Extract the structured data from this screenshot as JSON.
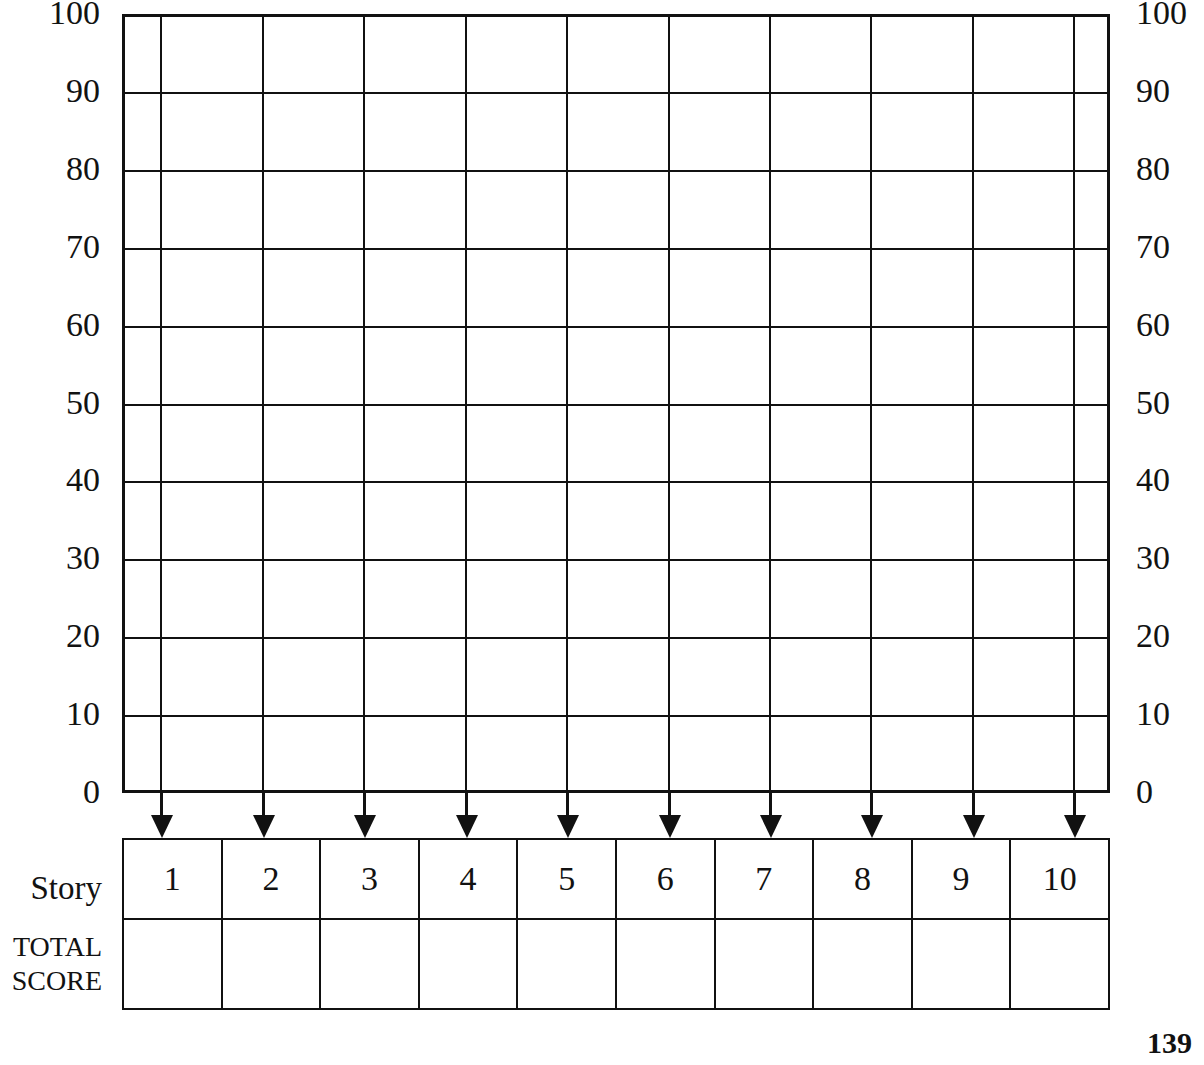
{
  "page": {
    "number": "139"
  },
  "chart_data": {
    "type": "table",
    "title": "",
    "xlabel": "Story",
    "ylabel": "",
    "ylim": [
      0,
      100
    ],
    "grid": true,
    "legend": null,
    "categories": [
      "1",
      "2",
      "3",
      "4",
      "5",
      "6",
      "7",
      "8",
      "9",
      "10"
    ],
    "values": [
      null,
      null,
      null,
      null,
      null,
      null,
      null,
      null,
      null,
      null
    ],
    "y_ticks": [
      100,
      90,
      80,
      70,
      60,
      50,
      40,
      30,
      20,
      10,
      0
    ],
    "y_ticks_left": [
      "100",
      "90",
      "80",
      "70",
      "60",
      "50",
      "40",
      "30",
      "20",
      "10",
      "0"
    ],
    "y_ticks_right": [
      "100",
      "90",
      "80",
      "70",
      "60",
      "50",
      "40",
      "30",
      "20",
      "10",
      "0"
    ]
  },
  "axes": {
    "left_ticks": [
      "100",
      "90",
      "80",
      "70",
      "60",
      "50",
      "40",
      "30",
      "20",
      "10",
      "0"
    ],
    "right_ticks": [
      "100",
      "90",
      "80",
      "70",
      "60",
      "50",
      "40",
      "30",
      "20",
      "10",
      "0"
    ]
  },
  "table": {
    "story_label": "Story",
    "total_label_line1": "TOTAL",
    "total_label_line2": "SCORE",
    "story_values": [
      "1",
      "2",
      "3",
      "4",
      "5",
      "6",
      "7",
      "8",
      "9",
      "10"
    ],
    "total_values": [
      "",
      "",
      "",
      "",
      "",
      "",
      "",
      "",
      "",
      ""
    ]
  },
  "arrows": {
    "count": 10,
    "icon": "arrow-down-icon"
  },
  "colors": {
    "ink": "#111111",
    "background": "#ffffff"
  }
}
